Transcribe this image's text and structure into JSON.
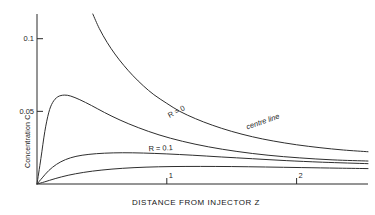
{
  "chart_data": {
    "type": "line",
    "title": "",
    "xlabel": "DISTANCE FROM INJECTOR Z",
    "ylabel": "Concentration C",
    "xlim": [
      0,
      2.55
    ],
    "ylim": [
      0,
      0.117
    ],
    "grid": false,
    "legend": "inline-curve-labels",
    "x_ticks": [
      {
        "value": 1,
        "label": "1"
      },
      {
        "value": 2,
        "label": "2"
      }
    ],
    "y_ticks": [
      {
        "value": 0.05,
        "label": "0.05"
      },
      {
        "value": 0.1,
        "label": "0.1"
      }
    ],
    "annotations": [
      {
        "text": "R = 0",
        "x": 1.02,
        "y": 0.0455,
        "rotation": -27
      },
      {
        "text": "centre line",
        "x": 1.62,
        "y": 0.0375,
        "rotation": -19
      },
      {
        "text": "R = 0.1",
        "x": 0.86,
        "y": 0.0225,
        "rotation": -3
      }
    ],
    "series": [
      {
        "name": "centre line",
        "label": "centre line",
        "points": [
          [
            0.43,
            0.117
          ],
          [
            0.48,
            0.107
          ],
          [
            0.54,
            0.0975
          ],
          [
            0.6,
            0.0895
          ],
          [
            0.67,
            0.0815
          ],
          [
            0.74,
            0.0745
          ],
          [
            0.82,
            0.0675
          ],
          [
            0.9,
            0.0615
          ],
          [
            1.0,
            0.0555
          ],
          [
            1.1,
            0.05
          ],
          [
            1.22,
            0.045
          ],
          [
            1.35,
            0.0405
          ],
          [
            1.5,
            0.0362
          ],
          [
            1.66,
            0.0325
          ],
          [
            1.82,
            0.0296
          ],
          [
            2.0,
            0.027
          ],
          [
            2.18,
            0.025
          ],
          [
            2.36,
            0.0234
          ],
          [
            2.55,
            0.0222
          ]
        ]
      },
      {
        "name": "R = 0",
        "label": "R = 0",
        "points": [
          [
            0.0,
            0.0
          ],
          [
            0.03,
            0.0175
          ],
          [
            0.06,
            0.036
          ],
          [
            0.09,
            0.049
          ],
          [
            0.12,
            0.056
          ],
          [
            0.16,
            0.06
          ],
          [
            0.21,
            0.0612
          ],
          [
            0.26,
            0.0605
          ],
          [
            0.33,
            0.058
          ],
          [
            0.42,
            0.054
          ],
          [
            0.52,
            0.0492
          ],
          [
            0.64,
            0.044
          ],
          [
            0.78,
            0.0388
          ],
          [
            0.94,
            0.0338
          ],
          [
            1.12,
            0.0294
          ],
          [
            1.32,
            0.0256
          ],
          [
            1.54,
            0.0224
          ],
          [
            1.78,
            0.0198
          ],
          [
            2.02,
            0.018
          ],
          [
            2.28,
            0.0166
          ],
          [
            2.55,
            0.0158
          ]
        ]
      },
      {
        "name": "R = 0.1",
        "label": "R = 0.1",
        "points": [
          [
            0.0,
            0.0
          ],
          [
            0.04,
            0.0042
          ],
          [
            0.09,
            0.0092
          ],
          [
            0.15,
            0.0135
          ],
          [
            0.22,
            0.0168
          ],
          [
            0.3,
            0.019
          ],
          [
            0.4,
            0.0204
          ],
          [
            0.52,
            0.0212
          ],
          [
            0.66,
            0.0215
          ],
          [
            0.82,
            0.0213
          ],
          [
            1.0,
            0.0207
          ],
          [
            1.2,
            0.0198
          ],
          [
            1.42,
            0.0186
          ],
          [
            1.66,
            0.0174
          ],
          [
            1.92,
            0.0161
          ],
          [
            2.2,
            0.015
          ],
          [
            2.55,
            0.014
          ]
        ]
      },
      {
        "name": "lower curve",
        "label": "",
        "points": [
          [
            0.0,
            0.0
          ],
          [
            0.06,
            0.0015
          ],
          [
            0.14,
            0.0037
          ],
          [
            0.24,
            0.006
          ],
          [
            0.36,
            0.008
          ],
          [
            0.5,
            0.0096
          ],
          [
            0.66,
            0.0108
          ],
          [
            0.84,
            0.0116
          ],
          [
            1.04,
            0.012
          ],
          [
            1.26,
            0.0121
          ],
          [
            1.5,
            0.012
          ],
          [
            1.76,
            0.0117
          ],
          [
            2.04,
            0.0113
          ],
          [
            2.32,
            0.0109
          ],
          [
            2.55,
            0.0106
          ]
        ]
      }
    ]
  },
  "axes": {
    "x_title": "DISTANCE FROM INJECTOR Z",
    "y_title": "Concentration C",
    "y_tick_top": "0.1",
    "y_tick_mid": "0.05",
    "x_tick_one": "1",
    "x_tick_two": "2"
  },
  "labels": {
    "r_zero": "R = 0",
    "centre_line": "centre line",
    "r_point_one": "R = 0.1"
  },
  "style": {
    "curve_color": "#2e2e2e",
    "axis_color": "#2b2b2b",
    "text_color": "#1a1a1a",
    "background": "#ffffff"
  }
}
